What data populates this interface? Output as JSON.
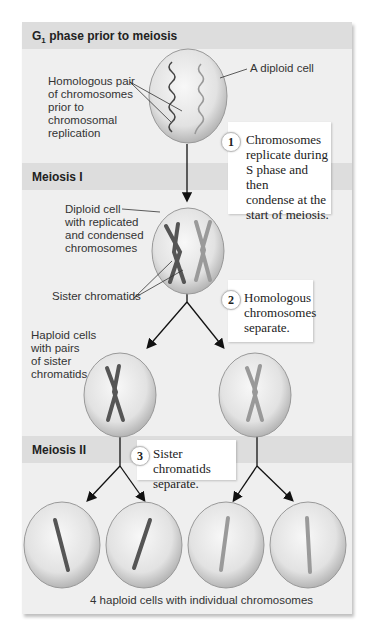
{
  "sections": {
    "g1": {
      "title_main": "G",
      "title_sub": "1",
      "title_rest": " phase prior to meiosis"
    },
    "meiosis1": {
      "title": "Meiosis I"
    },
    "meiosis2": {
      "title": "Meiosis II"
    }
  },
  "labels": {
    "homologous_pair": [
      "Homologous pair",
      "of chromosomes",
      "prior to",
      "chromosomal",
      "replication"
    ],
    "diploid_cell": "A diploid cell",
    "diploid_replicated": [
      "Diploid cell",
      "with replicated",
      "and condensed",
      "chromosomes"
    ],
    "sister_chromatids": "Sister chromatids",
    "haploid_pairs": [
      "Haploid cells",
      "with pairs",
      "of sister",
      "chromatids"
    ],
    "final_caption": "4 haploid cells with individual chromosomes"
  },
  "steps": [
    {
      "number": "1",
      "lines": [
        "Chromosomes",
        "replicate during",
        "S phase and then",
        "condense at the",
        "start of meiosis."
      ]
    },
    {
      "number": "2",
      "lines": [
        "Homologous",
        "chromosomes",
        "separate."
      ]
    },
    {
      "number": "3",
      "lines": [
        "Sister chromatids",
        "separate."
      ]
    }
  ],
  "colors": {
    "panel": "#efefef",
    "band": "#dddddd",
    "cell_fill": "#e4e4e4",
    "chromosome_dark": "#555555",
    "chromosome_light": "#9a9a9a"
  }
}
